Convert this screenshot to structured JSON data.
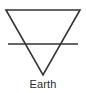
{
  "symbol": {
    "name": "Earth",
    "label": "Earth",
    "type": "alchemical-element-symbol",
    "stroke_color": "#333333",
    "background_color": "#ffffff",
    "text_color": "#2b2b2b",
    "geometry": {
      "shape": "inverted-triangle-with-horizontal-bar",
      "triangle_points": "6,10 80,10 43,75",
      "bar_y": 44,
      "bar_x1": 8,
      "bar_x2": 78,
      "stroke_width": 1.6
    }
  }
}
